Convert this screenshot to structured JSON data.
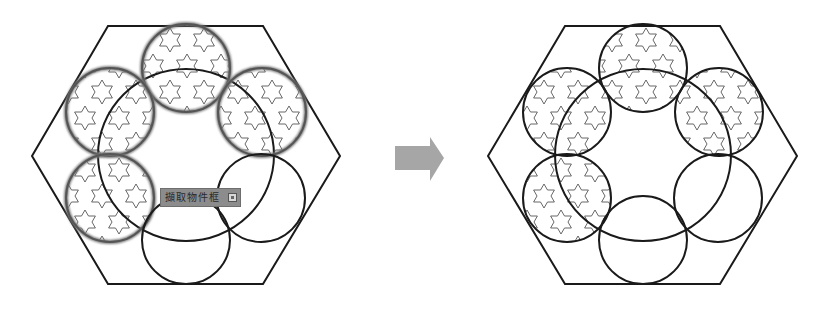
{
  "diagram": {
    "colors": {
      "stroke": "#1a1a1a",
      "selected_stroke": "#555555",
      "star_pattern": "#555555",
      "arrow": "#a0a0a0",
      "tooltip_bg": "#8c8c8c"
    },
    "left_panel": {
      "hexagon": [
        [
          108,
          26
        ],
        [
          263,
          26
        ],
        [
          340,
          156
        ],
        [
          263,
          284
        ],
        [
          108,
          284
        ],
        [
          32,
          156
        ]
      ],
      "center_circle": {
        "cx": 186,
        "cy": 155,
        "rx": 88,
        "ry": 86
      },
      "circles": [
        {
          "cx": 186,
          "cy": 68,
          "r": 44,
          "patterned": true,
          "selected": true
        },
        {
          "cx": 110,
          "cy": 112,
          "r": 44,
          "patterned": true,
          "selected": true
        },
        {
          "cx": 262,
          "cy": 112,
          "r": 44,
          "patterned": true,
          "selected": true
        },
        {
          "cx": 110,
          "cy": 198,
          "r": 44,
          "patterned": true,
          "selected": true
        },
        {
          "cx": 261,
          "cy": 198,
          "r": 44,
          "patterned": false,
          "selected": false
        },
        {
          "cx": 186,
          "cy": 240,
          "r": 44,
          "patterned": false,
          "selected": false
        }
      ],
      "tooltip": {
        "label": "擷取物件框",
        "icon": "expand-button-icon"
      }
    },
    "arrow": {
      "direction": "right",
      "icon": "right-arrow-icon"
    },
    "right_panel": {
      "hexagon": [
        [
          565,
          26
        ],
        [
          720,
          26
        ],
        [
          797,
          156
        ],
        [
          720,
          284
        ],
        [
          565,
          284
        ],
        [
          488,
          156
        ]
      ],
      "center_circle": {
        "cx": 643,
        "cy": 155,
        "rx": 88,
        "ry": 86
      },
      "circles": [
        {
          "cx": 643,
          "cy": 68,
          "r": 44,
          "patterned": true
        },
        {
          "cx": 567,
          "cy": 112,
          "r": 44,
          "patterned": true
        },
        {
          "cx": 719,
          "cy": 112,
          "r": 44,
          "patterned": true
        },
        {
          "cx": 567,
          "cy": 198,
          "r": 44,
          "patterned": true
        },
        {
          "cx": 718,
          "cy": 198,
          "r": 44,
          "patterned": false
        },
        {
          "cx": 643,
          "cy": 240,
          "r": 44,
          "patterned": false
        }
      ]
    }
  }
}
